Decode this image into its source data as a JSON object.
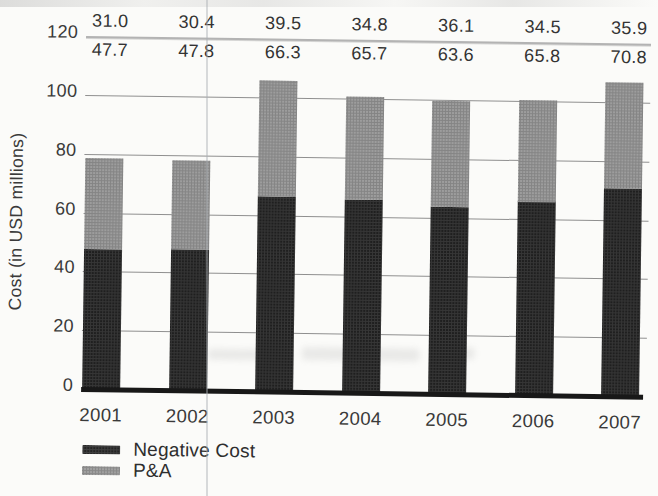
{
  "page": {
    "background_color": "#fbfbf9",
    "artifacts": {
      "vertical_scan_line_x": 207,
      "showthrough_smudge": "faint reversed-page text between 2002 and 2006 bars"
    }
  },
  "chart_data": {
    "type": "bar",
    "stacked": true,
    "title": "",
    "categories": [
      "2001",
      "2002",
      "2003",
      "2004",
      "2005",
      "2006",
      "2007"
    ],
    "series": [
      {
        "name": "Negative Cost",
        "color": "#1f1f1f",
        "values": [
          47.7,
          47.8,
          66.3,
          65.7,
          63.6,
          65.8,
          70.8
        ]
      },
      {
        "name": "P&A",
        "color": "#9d9d9d",
        "values": [
          31.0,
          30.4,
          39.5,
          34.8,
          36.1,
          34.5,
          35.9
        ]
      }
    ],
    "stack_order_bottom_to_top": [
      "Negative Cost",
      "P&A"
    ],
    "annotation_rows": [
      {
        "series": "P&A",
        "position": "above divider line",
        "labels": [
          "31.0",
          "30.4",
          "39.5",
          "34.8",
          "36.1",
          "34.5",
          "35.9"
        ]
      },
      {
        "series": "Negative Cost",
        "position": "below divider line",
        "labels": [
          "47.7",
          "47.8",
          "66.3",
          "65.7",
          "63.6",
          "65.8",
          "70.8"
        ]
      }
    ],
    "xlabel": "",
    "ylabel": "Cost (in USD millions)",
    "ylim": [
      0,
      120
    ],
    "yticks": [
      0,
      20,
      40,
      60,
      80,
      100,
      120
    ],
    "grid": true,
    "legend": {
      "position": "bottom-left",
      "entries": [
        "Negative Cost",
        "P&A"
      ]
    }
  }
}
